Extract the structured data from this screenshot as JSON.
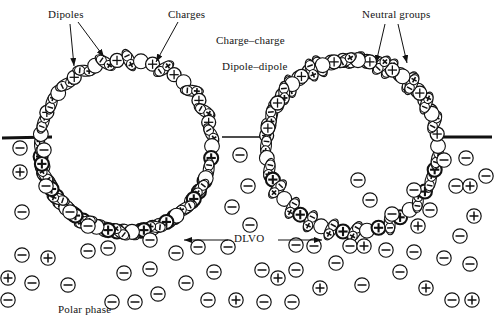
{
  "figure": {
    "type": "scientific-diagram",
    "width": 494,
    "height": 331,
    "background_color": "#ffffff",
    "ink_color": "#111111"
  },
  "labels": [
    {
      "id": "dipoles",
      "text": "Dipoles",
      "x": 48,
      "y": 8,
      "anchor": "start"
    },
    {
      "id": "charges",
      "text": "Charges",
      "x": 168,
      "y": 8,
      "anchor": "start"
    },
    {
      "id": "neutral_groups",
      "text": "Neutral groups",
      "x": 362,
      "y": 8,
      "anchor": "start"
    },
    {
      "id": "charge_charge",
      "text": "Charge–charge",
      "x": 216,
      "y": 34,
      "anchor": "start"
    },
    {
      "id": "dipole_dipole",
      "text": "Dipole–dipole",
      "x": 222,
      "y": 60,
      "anchor": "start"
    },
    {
      "id": "dlvo",
      "text": "DLVO",
      "x": 234,
      "y": 232,
      "anchor": "start"
    },
    {
      "id": "polar_phase",
      "text": "Polar phase",
      "x": 58,
      "y": 303,
      "anchor": "start"
    }
  ],
  "annotation_arrows": [
    {
      "id": "dipoles-arrow-1",
      "from": [
        70,
        24
      ],
      "to": [
        74,
        66
      ],
      "label_ref": "dipoles"
    },
    {
      "id": "dipoles-arrow-2",
      "from": [
        78,
        22
      ],
      "to": [
        104,
        57
      ],
      "label_ref": "dipoles"
    },
    {
      "id": "charges-arrow-1",
      "from": [
        178,
        22
      ],
      "to": [
        156,
        62
      ],
      "label_ref": "charges"
    },
    {
      "id": "neutral-arrow-1",
      "from": [
        385,
        24
      ],
      "to": [
        376,
        63
      ],
      "label_ref": "neutral_groups"
    },
    {
      "id": "neutral-arrow-2",
      "from": [
        398,
        24
      ],
      "to": [
        407,
        63
      ],
      "label_ref": "neutral_groups"
    },
    {
      "id": "dlvo-arrow-left",
      "from": [
        228,
        240
      ],
      "to": [
        184,
        240
      ],
      "label_ref": "dlvo"
    },
    {
      "id": "dlvo-arrow-right",
      "from": [
        278,
        240
      ],
      "to": [
        322,
        240
      ],
      "label_ref": "dlvo"
    }
  ],
  "interface_lines": [
    {
      "id": "interface-left",
      "x1": 2,
      "y1": 138,
      "x2": 52,
      "y2": 137,
      "width": 3
    },
    {
      "id": "interface-right",
      "x1": 441,
      "y1": 137,
      "x2": 492,
      "y2": 137,
      "width": 3
    },
    {
      "id": "interface-middle",
      "x1": 222,
      "y1": 137,
      "x2": 272,
      "y2": 137,
      "width": 1.6
    }
  ],
  "droplets": [
    {
      "id": "droplet-left",
      "cx": 126,
      "cy": 146,
      "r": 86,
      "shell": "surfactant-monolayer"
    },
    {
      "id": "droplet-right",
      "cx": 352,
      "cy": 146,
      "r": 86,
      "shell": "surfactant-monolayer"
    }
  ],
  "legend_glyphs": [
    {
      "id": "neutral-group-glyph",
      "symbol": "circle",
      "meaning": "Neutral groups"
    },
    {
      "id": "positive-charge-glyph",
      "symbol": "⊕",
      "meaning": "Positive charge"
    },
    {
      "id": "negative-charge-glyph",
      "symbol": "⊖",
      "meaning": "Negative charge (counter-ion)"
    },
    {
      "id": "dipole-glyph",
      "symbol": "ellipse-plus-minus",
      "meaning": "Dipole"
    }
  ],
  "shell_left": {
    "note": "Alternating neutral circles, circled plus charges and tilted dipole ellipses around the droplet rim",
    "units": [
      {
        "t": "dipole",
        "a": -112,
        "rot": -30
      },
      {
        "t": "circle",
        "a": -104
      },
      {
        "t": "plus",
        "a": -97
      },
      {
        "t": "dipole",
        "a": -90,
        "rot": -6
      },
      {
        "t": "circle",
        "a": -82
      },
      {
        "t": "dipole",
        "a": -74,
        "rot": 4
      },
      {
        "t": "plus",
        "a": -67
      },
      {
        "t": "dipole",
        "a": -60,
        "rot": -14
      },
      {
        "t": "circle",
        "a": -52
      },
      {
        "t": "dipole",
        "a": -44,
        "rot": 18
      },
      {
        "t": "plus",
        "a": -37
      },
      {
        "t": "dipole",
        "a": -29,
        "rot": 34
      },
      {
        "t": "circle",
        "a": -21
      },
      {
        "t": "dipole",
        "a": -14,
        "rot": 48
      },
      {
        "t": "plus",
        "a": -6
      },
      {
        "t": "dipole",
        "a": 2,
        "rot": 62
      },
      {
        "t": "circle",
        "a": 10
      },
      {
        "t": "plus",
        "a": 18
      },
      {
        "t": "dipole",
        "a": 26,
        "rot": -60
      },
      {
        "t": "plus",
        "a": 34
      },
      {
        "t": "circle",
        "a": 42
      },
      {
        "t": "dipole",
        "a": 50,
        "rot": -46
      },
      {
        "t": "plus",
        "a": 58
      },
      {
        "t": "dipole",
        "a": 66,
        "rot": -36
      },
      {
        "t": "plus",
        "a": 74
      },
      {
        "t": "dipole",
        "a": 82,
        "rot": -24
      },
      {
        "t": "circle",
        "a": 90
      },
      {
        "t": "plus",
        "a": 98
      },
      {
        "t": "dipole",
        "a": 106,
        "rot": -10
      },
      {
        "t": "plus",
        "a": 114
      },
      {
        "t": "plus",
        "a": 122
      },
      {
        "t": "circle",
        "a": 130
      },
      {
        "t": "dipole",
        "a": 138,
        "rot": 16
      },
      {
        "t": "plus",
        "a": 146
      },
      {
        "t": "dipole",
        "a": 154,
        "rot": 26
      },
      {
        "t": "circle",
        "a": 162
      },
      {
        "t": "plus",
        "a": 170
      },
      {
        "t": "dipole",
        "a": 178,
        "rot": 36
      },
      {
        "t": "plus",
        "a": 186
      },
      {
        "t": "circle",
        "a": 194
      },
      {
        "t": "dipole",
        "a": 202,
        "rot": -38
      },
      {
        "t": "plus",
        "a": 210
      },
      {
        "t": "circle",
        "a": 218
      },
      {
        "t": "dipole",
        "a": 226,
        "rot": -30
      },
      {
        "t": "plus",
        "a": 234
      },
      {
        "t": "circle",
        "a": 242
      },
      {
        "t": "dipole",
        "a": 250,
        "rot": -16
      },
      {
        "t": "plus",
        "a": 258
      },
      {
        "t": "circle",
        "a": -248
      },
      {
        "t": "dipole",
        "a": -240,
        "rot": 8
      },
      {
        "t": "plus",
        "a": -232
      },
      {
        "t": "dipole",
        "a": -224,
        "rot": 18
      },
      {
        "t": "circle",
        "a": -216
      },
      {
        "t": "plus",
        "a": -208
      },
      {
        "t": "dipole",
        "a": -200,
        "rot": 26
      },
      {
        "t": "plus",
        "a": -192
      },
      {
        "t": "circle",
        "a": -184
      },
      {
        "t": "dipole",
        "a": -176,
        "rot": 34
      },
      {
        "t": "plus",
        "a": -168
      },
      {
        "t": "circle",
        "a": -160
      },
      {
        "t": "dipole",
        "a": -152,
        "rot": -42
      },
      {
        "t": "plus",
        "a": -144
      },
      {
        "t": "circle",
        "a": -136
      },
      {
        "t": "dipole",
        "a": -128,
        "rot": -34
      },
      {
        "t": "plus",
        "a": -120
      }
    ]
  },
  "shell_right": {
    "note": "Mirrored arrangement of the left droplet shell",
    "mirror_of": "shell_left"
  },
  "free_ions": [
    {
      "s": "-",
      "x": 20,
      "y": 148
    },
    {
      "s": "+",
      "x": 20,
      "y": 172
    },
    {
      "s": "-",
      "x": 22,
      "y": 212
    },
    {
      "s": "-",
      "x": 44,
      "y": 150
    },
    {
      "s": "-",
      "x": 46,
      "y": 186
    },
    {
      "s": "-",
      "x": 70,
      "y": 212
    },
    {
      "s": "-",
      "x": 22,
      "y": 255
    },
    {
      "s": "+",
      "x": 48,
      "y": 258
    },
    {
      "s": "-",
      "x": 32,
      "y": 283
    },
    {
      "s": "-",
      "x": 68,
      "y": 285
    },
    {
      "s": "-",
      "x": 88,
      "y": 251
    },
    {
      "s": "-",
      "x": 108,
      "y": 248
    },
    {
      "s": "-",
      "x": 124,
      "y": 273
    },
    {
      "s": "-",
      "x": 112,
      "y": 302
    },
    {
      "s": "-",
      "x": 135,
      "y": 302
    },
    {
      "s": "-",
      "x": 150,
      "y": 269
    },
    {
      "s": "-",
      "x": 158,
      "y": 294
    },
    {
      "s": "-",
      "x": 150,
      "y": 240
    },
    {
      "s": "-",
      "x": 88,
      "y": 226
    },
    {
      "s": "-",
      "x": 176,
      "y": 253
    },
    {
      "s": "-",
      "x": 186,
      "y": 283
    },
    {
      "s": "-",
      "x": 198,
      "y": 247
    },
    {
      "s": "-",
      "x": 214,
      "y": 272
    },
    {
      "s": "-",
      "x": 208,
      "y": 300
    },
    {
      "s": "+",
      "x": 236,
      "y": 300
    },
    {
      "s": "-",
      "x": 240,
      "y": 155
    },
    {
      "s": "-",
      "x": 248,
      "y": 186
    },
    {
      "s": "-",
      "x": 232,
      "y": 207
    },
    {
      "s": "-",
      "x": 250,
      "y": 225
    },
    {
      "s": "-",
      "x": 228,
      "y": 247
    },
    {
      "s": "-",
      "x": 262,
      "y": 270
    },
    {
      "s": "+",
      "x": 278,
      "y": 278
    },
    {
      "s": "-",
      "x": 296,
      "y": 270
    },
    {
      "s": "-",
      "x": 264,
      "y": 302
    },
    {
      "s": "-",
      "x": 292,
      "y": 302
    },
    {
      "s": "-",
      "x": 296,
      "y": 245
    },
    {
      "s": "-",
      "x": 314,
      "y": 246
    },
    {
      "s": "+",
      "x": 320,
      "y": 288
    },
    {
      "s": "-",
      "x": 336,
      "y": 263
    },
    {
      "s": "-",
      "x": 350,
      "y": 246
    },
    {
      "s": "-",
      "x": 362,
      "y": 285
    },
    {
      "s": "+",
      "x": 364,
      "y": 246
    },
    {
      "s": "-",
      "x": 386,
      "y": 250
    },
    {
      "s": "-",
      "x": 400,
      "y": 272
    },
    {
      "s": "-",
      "x": 414,
      "y": 252
    },
    {
      "s": "+",
      "x": 426,
      "y": 288
    },
    {
      "s": "-",
      "x": 444,
      "y": 258
    },
    {
      "s": "-",
      "x": 460,
      "y": 236
    },
    {
      "s": "-",
      "x": 470,
      "y": 264
    },
    {
      "s": "-",
      "x": 452,
      "y": 300
    },
    {
      "s": "+",
      "x": 472,
      "y": 300
    },
    {
      "s": "-",
      "x": 430,
      "y": 210
    },
    {
      "s": "-",
      "x": 456,
      "y": 186
    },
    {
      "s": "+",
      "x": 470,
      "y": 186
    },
    {
      "s": "-",
      "x": 444,
      "y": 160
    },
    {
      "s": "-",
      "x": 466,
      "y": 158
    },
    {
      "s": "-",
      "x": 414,
      "y": 190
    },
    {
      "s": "+",
      "x": 418,
      "y": 226
    },
    {
      "s": "-",
      "x": 392,
      "y": 214
    },
    {
      "s": "-",
      "x": 370,
      "y": 200
    },
    {
      "s": "-",
      "x": 358,
      "y": 180
    },
    {
      "s": "+",
      "x": 474,
      "y": 216
    },
    {
      "s": "-",
      "x": 486,
      "y": 176
    },
    {
      "s": "-",
      "x": 8,
      "y": 300
    },
    {
      "s": "+",
      "x": 8,
      "y": 278
    }
  ]
}
